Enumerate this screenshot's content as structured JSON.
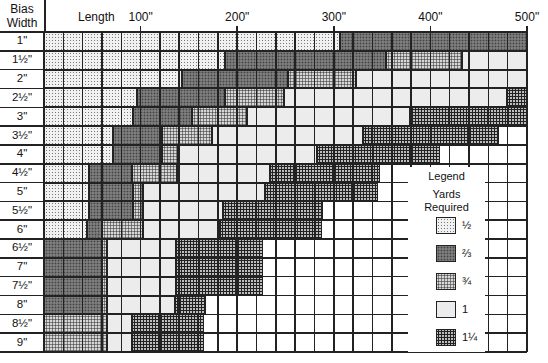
{
  "header": {
    "bias_label_line1": "Bias",
    "bias_label_line2": "Width",
    "length_label": "Length"
  },
  "legend": {
    "title": "Legend",
    "subtitle_line1": "Yards",
    "subtitle_line2": "Required",
    "items": [
      {
        "key": "half",
        "label": "½"
      },
      {
        "key": "twothirds",
        "label": "⅔"
      },
      {
        "key": "threequarters",
        "label": "¾"
      },
      {
        "key": "one",
        "label": "1"
      },
      {
        "key": "oneq",
        "label": "1¼"
      }
    ]
  },
  "chart_data": {
    "type": "heatmap",
    "title": "",
    "xlabel": "Length",
    "ylabel": "Bias Width",
    "x_range": [
      0,
      500
    ],
    "x_ticks": [
      {
        "value": 100,
        "label": "100\""
      },
      {
        "value": 200,
        "label": "200\""
      },
      {
        "value": 300,
        "label": "300\""
      },
      {
        "value": 400,
        "label": "400\""
      },
      {
        "value": 500,
        "label": "500\""
      }
    ],
    "grid_step": 20,
    "legend_title": "Legend — Yards Required",
    "categories": [
      "1\"",
      "1½\"",
      "2\"",
      "2½\"",
      "3\"",
      "3½\"",
      "4\"",
      "4½\"",
      "5\"",
      "5½\"",
      "6\"",
      "6½\"",
      "7\"",
      "7½\"",
      "8\"",
      "8½\"",
      "9\""
    ],
    "rows": [
      {
        "width": "1\"",
        "segments": [
          {
            "yards": "half",
            "from": 0,
            "to": 306
          },
          {
            "yards": "twothirds",
            "from": 306,
            "to": 500
          }
        ]
      },
      {
        "width": "1½\"",
        "segments": [
          {
            "yards": "half",
            "from": 0,
            "to": 187
          },
          {
            "yards": "twothirds",
            "from": 187,
            "to": 354
          },
          {
            "yards": "threequarters",
            "from": 354,
            "to": 433
          },
          {
            "yards": "one",
            "from": 433,
            "to": 500
          }
        ]
      },
      {
        "width": "2\"",
        "segments": [
          {
            "yards": "half",
            "from": 0,
            "to": 143
          },
          {
            "yards": "twothirds",
            "from": 143,
            "to": 253
          },
          {
            "yards": "threequarters",
            "from": 253,
            "to": 323
          },
          {
            "yards": "one",
            "from": 323,
            "to": 500
          }
        ]
      },
      {
        "width": "2½\"",
        "segments": [
          {
            "yards": "half",
            "from": 0,
            "to": 96
          },
          {
            "yards": "twothirds",
            "from": 96,
            "to": 187
          },
          {
            "yards": "threequarters",
            "from": 187,
            "to": 248
          },
          {
            "yards": "one",
            "from": 248,
            "to": 479
          },
          {
            "yards": "oneq",
            "from": 479,
            "to": 500
          }
        ]
      },
      {
        "width": "3\"",
        "segments": [
          {
            "yards": "half",
            "from": 0,
            "to": 92
          },
          {
            "yards": "twothirds",
            "from": 92,
            "to": 153
          },
          {
            "yards": "threequarters",
            "from": 153,
            "to": 210
          },
          {
            "yards": "one",
            "from": 210,
            "to": 379
          },
          {
            "yards": "oneq",
            "from": 379,
            "to": 500
          }
        ]
      },
      {
        "width": "3½\"",
        "segments": [
          {
            "yards": "half",
            "from": 0,
            "to": 71
          },
          {
            "yards": "twothirds",
            "from": 71,
            "to": 122
          },
          {
            "yards": "threequarters",
            "from": 122,
            "to": 174
          },
          {
            "yards": "one",
            "from": 174,
            "to": 330
          },
          {
            "yards": "oneq",
            "from": 330,
            "to": 471
          }
        ]
      },
      {
        "width": "4\"",
        "segments": [
          {
            "yards": "half",
            "from": 0,
            "to": 71
          },
          {
            "yards": "twothirds",
            "from": 71,
            "to": 122
          },
          {
            "yards": "threequarters",
            "from": 122,
            "to": 139
          },
          {
            "yards": "one",
            "from": 139,
            "to": 283
          },
          {
            "yards": "oneq",
            "from": 283,
            "to": 410
          }
        ]
      },
      {
        "width": "4½\"",
        "segments": [
          {
            "yards": "half",
            "from": 0,
            "to": 47
          },
          {
            "yards": "twothirds",
            "from": 47,
            "to": 91
          },
          {
            "yards": "threequarters",
            "from": 91,
            "to": 138
          },
          {
            "yards": "one",
            "from": 138,
            "to": 234
          },
          {
            "yards": "oneq",
            "from": 234,
            "to": 348
          }
        ]
      },
      {
        "width": "5\"",
        "segments": [
          {
            "yards": "half",
            "from": 0,
            "to": 47
          },
          {
            "yards": "twothirds",
            "from": 47,
            "to": 92
          },
          {
            "yards": "threequarters",
            "from": 92,
            "to": 102
          },
          {
            "yards": "one",
            "from": 102,
            "to": 229
          },
          {
            "yards": "oneq",
            "from": 229,
            "to": 346
          }
        ]
      },
      {
        "width": "5½\"",
        "segments": [
          {
            "yards": "half",
            "from": 0,
            "to": 47
          },
          {
            "yards": "twothirds",
            "from": 47,
            "to": 92
          },
          {
            "yards": "threequarters",
            "from": 92,
            "to": 102
          },
          {
            "yards": "one",
            "from": 102,
            "to": 185
          },
          {
            "yards": "oneq",
            "from": 185,
            "to": 289
          }
        ]
      },
      {
        "width": "6\"",
        "segments": [
          {
            "yards": "half",
            "from": 0,
            "to": 45
          },
          {
            "yards": "twothirds",
            "from": 45,
            "to": 60
          },
          {
            "yards": "threequarters",
            "from": 60,
            "to": 102
          },
          {
            "yards": "one",
            "from": 102,
            "to": 182
          },
          {
            "yards": "oneq",
            "from": 182,
            "to": 288
          }
        ]
      },
      {
        "width": "6½\"",
        "segments": [
          {
            "yards": "twothirds",
            "from": 0,
            "to": 60
          },
          {
            "yards": "threequarters",
            "from": 60,
            "to": 65
          },
          {
            "yards": "one",
            "from": 65,
            "to": 137
          },
          {
            "yards": "oneq",
            "from": 137,
            "to": 227
          }
        ]
      },
      {
        "width": "7\"",
        "segments": [
          {
            "yards": "twothirds",
            "from": 0,
            "to": 60
          },
          {
            "yards": "threequarters",
            "from": 60,
            "to": 65
          },
          {
            "yards": "one",
            "from": 65,
            "to": 137
          },
          {
            "yards": "oneq",
            "from": 137,
            "to": 227
          }
        ]
      },
      {
        "width": "7½\"",
        "segments": [
          {
            "yards": "twothirds",
            "from": 0,
            "to": 60
          },
          {
            "yards": "threequarters",
            "from": 60,
            "to": 65
          },
          {
            "yards": "one",
            "from": 65,
            "to": 137
          },
          {
            "yards": "oneq",
            "from": 137,
            "to": 227
          }
        ]
      },
      {
        "width": "8\"",
        "segments": [
          {
            "yards": "twothirds",
            "from": 0,
            "to": 60
          },
          {
            "yards": "threequarters",
            "from": 60,
            "to": 65
          },
          {
            "yards": "one",
            "from": 65,
            "to": 136
          },
          {
            "yards": "oneq",
            "from": 136,
            "to": 168
          }
        ]
      },
      {
        "width": "8½\"",
        "segments": [
          {
            "yards": "threequarters",
            "from": 0,
            "to": 65
          },
          {
            "yards": "one",
            "from": 65,
            "to": 91
          },
          {
            "yards": "oneq",
            "from": 91,
            "to": 166
          }
        ]
      },
      {
        "width": "9\"",
        "segments": [
          {
            "yards": "threequarters",
            "from": 0,
            "to": 65
          },
          {
            "yards": "one",
            "from": 65,
            "to": 91
          },
          {
            "yards": "oneq",
            "from": 91,
            "to": 166
          }
        ]
      }
    ],
    "yards_legend": {
      "half": "½",
      "twothirds": "⅔",
      "threequarters": "¾",
      "one": "1",
      "oneq": "1¼"
    }
  }
}
